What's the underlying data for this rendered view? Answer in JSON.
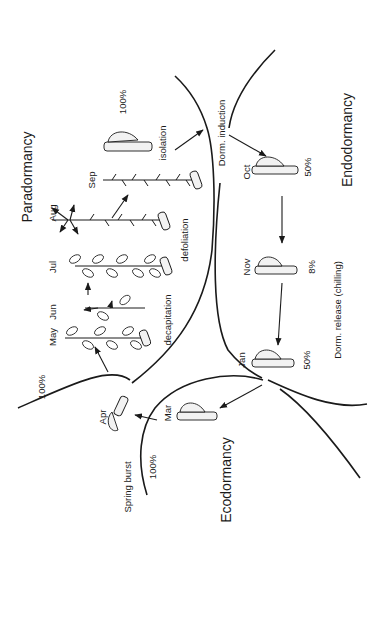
{
  "figure": {
    "type": "dormancy-cycle-diagram",
    "orientation": "rotated-90-ccw",
    "colors": {
      "ink": "#1a1a1a",
      "background": "#ffffff"
    }
  },
  "phases": {
    "paradormancy": "Paradormancy",
    "endodormancy": "Endodormancy",
    "ecodormancy": "Ecodormancy"
  },
  "transitions": {
    "dorm_induction": "Dorm. induction",
    "dorm_release": "Dorm. release (chilling)",
    "spring_burst": "Spring burst"
  },
  "treatments": {
    "decapitation": "decapitation",
    "defoliation": "defoliation",
    "isolation": "isolation"
  },
  "months": {
    "may": "May",
    "jun": "Jun",
    "jul": "Jul",
    "aug": "Aug",
    "sep": "Sep",
    "oct": "Oct",
    "nov": "Nov",
    "jan": "Jan",
    "mar": "Mar",
    "apr": "Apr"
  },
  "percentages": {
    "isolation": "100%",
    "oct": "50%",
    "nov": "8%",
    "jan": "50%",
    "paradormancy_apr": "100%",
    "spring_burst": "100%"
  }
}
